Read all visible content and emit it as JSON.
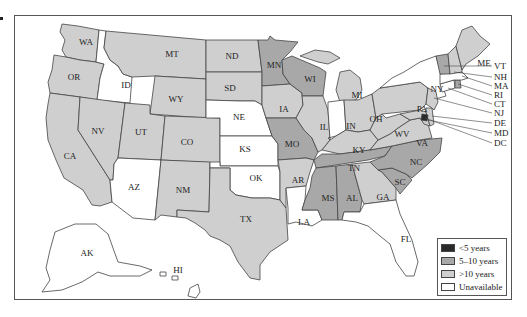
{
  "colors": {
    "lt5": "#2a2a2a",
    "b5_10": "#a8a8a8",
    "gt10": "#cfcfcf",
    "unavailable": "#ffffff",
    "stroke": "#444444"
  },
  "legend": {
    "items": [
      {
        "label": "<5 years",
        "category": "lt5"
      },
      {
        "label": "5–10 years",
        "category": "b5_10"
      },
      {
        "label": ">10 years",
        "category": "gt10"
      },
      {
        "label": "Unavailable",
        "category": "unavailable"
      }
    ]
  },
  "states": {
    "WA": {
      "label": "WA",
      "category": "gt10"
    },
    "OR": {
      "label": "OR",
      "category": "gt10"
    },
    "CA": {
      "label": "CA",
      "category": "gt10"
    },
    "ID": {
      "label": "ID",
      "category": "unavailable"
    },
    "NV": {
      "label": "NV",
      "category": "gt10"
    },
    "MT": {
      "label": "MT",
      "category": "gt10"
    },
    "WY": {
      "label": "WY",
      "category": "gt10"
    },
    "UT": {
      "label": "UT",
      "category": "gt10"
    },
    "AZ": {
      "label": "AZ",
      "category": "unavailable"
    },
    "CO": {
      "label": "CO",
      "category": "gt10"
    },
    "NM": {
      "label": "NM",
      "category": "gt10"
    },
    "ND": {
      "label": "ND",
      "category": "gt10"
    },
    "SD": {
      "label": "SD",
      "category": "gt10"
    },
    "NE": {
      "label": "NE",
      "category": "unavailable"
    },
    "KS": {
      "label": "KS",
      "category": "unavailable"
    },
    "OK": {
      "label": "OK",
      "category": "unavailable"
    },
    "TX": {
      "label": "TX",
      "category": "gt10"
    },
    "MN": {
      "label": "MN",
      "category": "b5_10"
    },
    "IA": {
      "label": "IA",
      "category": "gt10"
    },
    "MO": {
      "label": "MO",
      "category": "b5_10"
    },
    "AR": {
      "label": "AR",
      "category": "gt10"
    },
    "LA": {
      "label": "LA",
      "category": "unavailable"
    },
    "WI": {
      "label": "WI",
      "category": "b5_10"
    },
    "IL": {
      "label": "IL",
      "category": "gt10"
    },
    "MI": {
      "label": "MI",
      "category": "gt10"
    },
    "IN": {
      "label": "IN",
      "category": "unavailable"
    },
    "OH": {
      "label": "OH",
      "category": "gt10"
    },
    "KY": {
      "label": "KY",
      "category": "gt10"
    },
    "TN": {
      "label": "TN",
      "category": "b5_10"
    },
    "MS": {
      "label": "MS",
      "category": "b5_10"
    },
    "AL": {
      "label": "AL",
      "category": "b5_10"
    },
    "GA": {
      "label": "GA",
      "category": "gt10"
    },
    "FL": {
      "label": "FL",
      "category": "unavailable"
    },
    "SC": {
      "label": "SC",
      "category": "b5_10"
    },
    "NC": {
      "label": "NC",
      "category": "b5_10"
    },
    "VA": {
      "label": "VA",
      "category": "gt10"
    },
    "WV": {
      "label": "WV",
      "category": "gt10"
    },
    "PA": {
      "label": "PA",
      "category": "gt10"
    },
    "NY": {
      "label": "NY",
      "category": "unavailable"
    },
    "VT": {
      "label": "VT",
      "category": "b5_10"
    },
    "NH": {
      "label": "NH",
      "category": "gt10"
    },
    "ME": {
      "label": "ME",
      "category": "gt10"
    },
    "MA": {
      "label": "MA",
      "category": "unavailable"
    },
    "RI": {
      "label": "RI",
      "category": "b5_10"
    },
    "CT": {
      "label": "CT",
      "category": "unavailable"
    },
    "NJ": {
      "label": "NJ",
      "category": "gt10"
    },
    "DE": {
      "label": "DE",
      "category": "gt10"
    },
    "MD": {
      "label": "MD",
      "category": "gt10"
    },
    "DC": {
      "label": "DC",
      "category": "lt5"
    },
    "AK": {
      "label": "AK",
      "category": "unavailable"
    },
    "HI": {
      "label": "HI",
      "category": "unavailable"
    }
  }
}
